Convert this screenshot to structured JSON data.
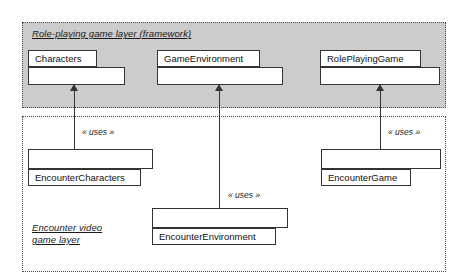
{
  "diagram": {
    "type": "uml-layer-package-diagram",
    "colors": {
      "framework_layer_fill": "#cccccc",
      "game_layer_fill": "#ffffff",
      "box_fill": "#ffffff",
      "line": "#333333",
      "text": "#111111"
    }
  },
  "layers": [
    {
      "id": "framework-layer",
      "label": "Role-playing game layer (framework)",
      "fill": "#cccccc",
      "classes": [
        {
          "id": "characters",
          "name": "Characters"
        },
        {
          "id": "game-environment",
          "name": "GameEnvironment"
        },
        {
          "id": "role-playing-game",
          "name": "RolePlayingGame"
        }
      ]
    },
    {
      "id": "encounter-layer",
      "label": "Encounter video\ngame layer",
      "fill": "#ffffff",
      "classes": [
        {
          "id": "encounter-characters",
          "name": "EncounterCharacters"
        },
        {
          "id": "encounter-environment",
          "name": "EncounterEnvironment"
        },
        {
          "id": "encounter-game",
          "name": "EncounterGame"
        }
      ]
    }
  ],
  "dependencies": [
    {
      "id": "dep-characters",
      "from": "EncounterCharacters",
      "to": "Characters",
      "stereotype": "« uses »"
    },
    {
      "id": "dep-environment",
      "from": "EncounterEnvironment",
      "to": "GameEnvironment",
      "stereotype": "« uses »"
    },
    {
      "id": "dep-game",
      "from": "EncounterGame",
      "to": "RolePlayingGame",
      "stereotype": "« uses »"
    }
  ]
}
